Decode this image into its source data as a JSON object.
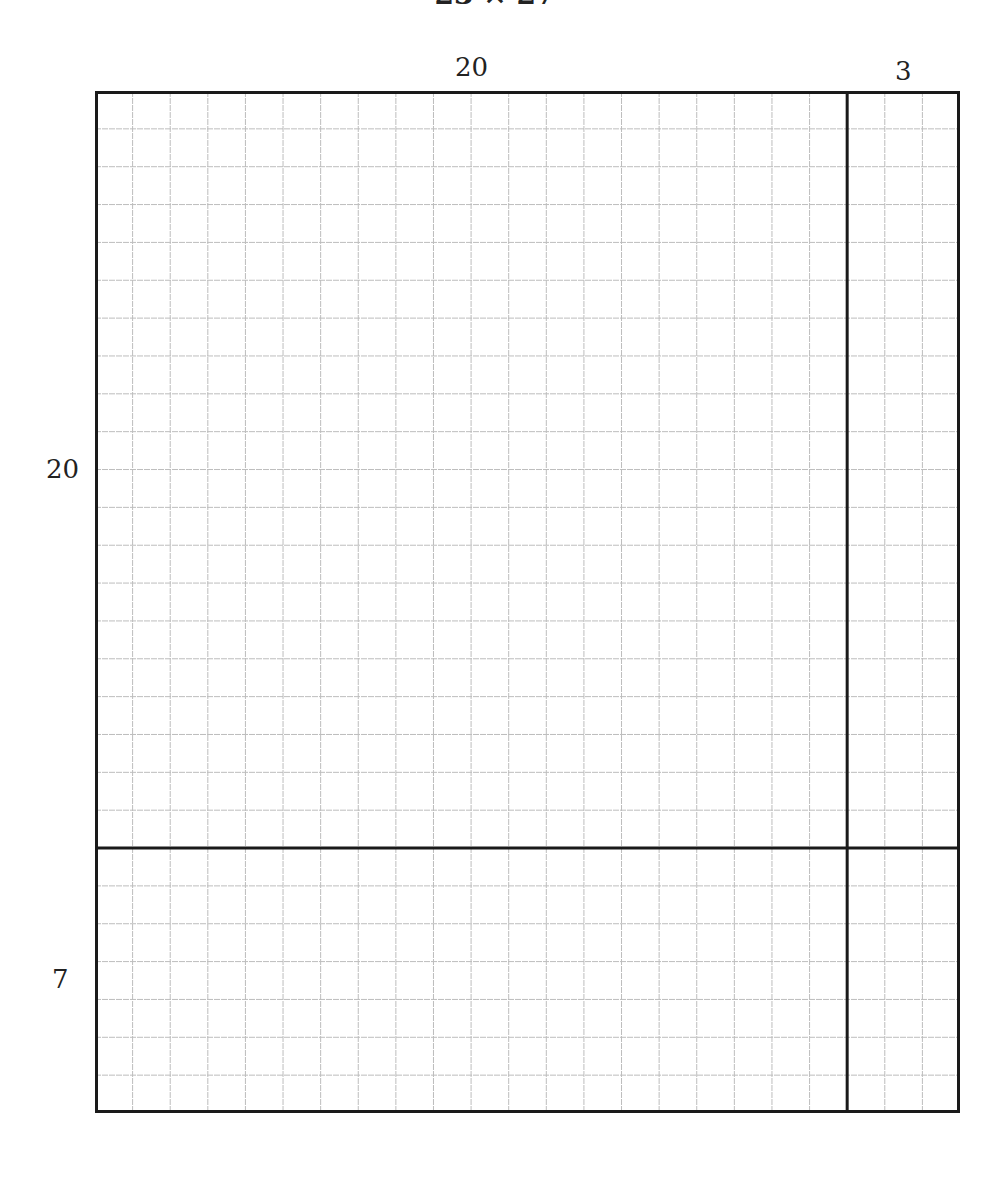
{
  "caption": "23 × 27",
  "labels": {
    "top_width": "20",
    "top_right_width": "3",
    "left_height": "20",
    "bottom_height": "7"
  },
  "grid": {
    "columns_main": 20,
    "columns_extra": 3,
    "rows_main": 20,
    "rows_extra": 7,
    "cell_px": 37.7,
    "gridline_color": "#bdbdbd",
    "border_color": "#1a1a1a"
  }
}
